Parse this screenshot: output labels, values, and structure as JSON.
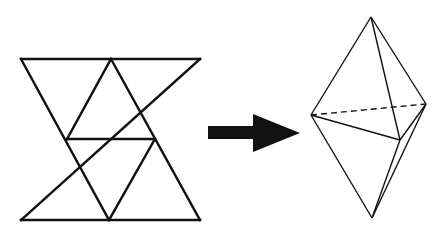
{
  "diagram": {
    "colors": {
      "stroke": "#111111",
      "background": "#ffffff",
      "arrow": "#111111"
    },
    "net": {
      "label": "net-of-six-triangles",
      "triangle_count": 6
    },
    "arrow": {
      "direction": "right"
    },
    "solid": {
      "label": "triangular-bipyramid",
      "vertices": {
        "top": [
          371,
          17
        ],
        "left": [
          311,
          115
        ],
        "right": [
          426,
          104
        ],
        "front": [
          400,
          140
        ],
        "bottom": [
          372,
          218
        ]
      },
      "hidden_edge": "left-right (dashed)"
    }
  }
}
